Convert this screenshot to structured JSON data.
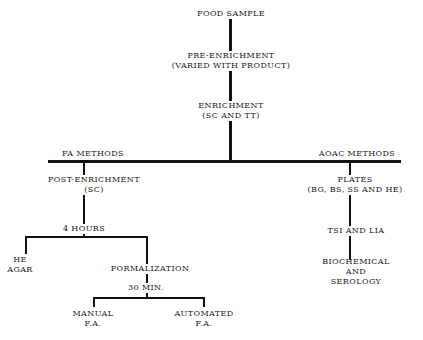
{
  "diagram": {
    "type": "flowchart",
    "nodes": {
      "food_sample": "FOOD SAMPLE",
      "pre_enrichment": "PRE-ENRICHMENT",
      "pre_enrichment_note": "(VARIED WITH PRODUCT)",
      "enrichment": "ENRICHMENT",
      "enrichment_note": "(SC AND TT)",
      "fa_methods": "FA METHODS",
      "aoac_methods": "AOAC METHODS",
      "post_enrichment": "POST-ENRICHMENT",
      "post_enrichment_note": "(SC)",
      "four_hours": "4 HOURS",
      "he": "HE",
      "agar": "AGAR",
      "formalization": "FORMALIZATION",
      "thirty_min": "30 MIN.",
      "manual": "MANUAL",
      "manual_fa": "F.A.",
      "automated": "AUTOMATED",
      "automated_fa": "F.A.",
      "plates": "PLATES",
      "plates_note": "(BG, BS, SS AND HE)",
      "tsi_lia": "TSI AND LIA",
      "biochemical": "BIOCHEMICAL",
      "and": "AND",
      "serology": "SEROLOGY"
    }
  }
}
